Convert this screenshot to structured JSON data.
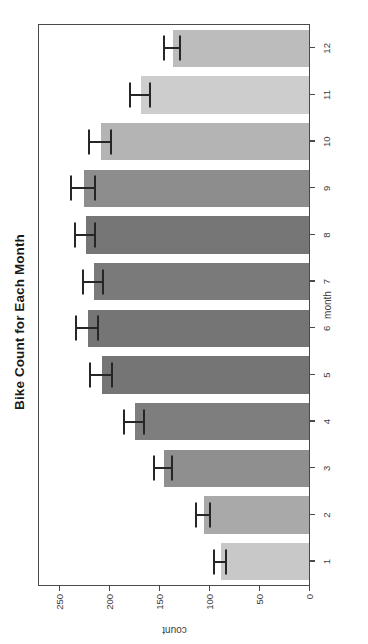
{
  "chart_data": {
    "type": "bar",
    "title": "Bike Count for Each Month",
    "xlabel": "month",
    "ylabel": "count",
    "categories": [
      "1",
      "2",
      "3",
      "4",
      "5",
      "6",
      "7",
      "8",
      "9",
      "10",
      "11",
      "12"
    ],
    "values": [
      88,
      105,
      145,
      174,
      207,
      221,
      215,
      223,
      225,
      208,
      168,
      136
    ],
    "errors": [
      6,
      7,
      9,
      10,
      11,
      11,
      10,
      10,
      12,
      11,
      10,
      8
    ],
    "bar_colors": [
      "#c8c8c8",
      "#a9a9a9",
      "#8f8f8f",
      "#7e7e7e",
      "#757575",
      "#757575",
      "#7a7a7a",
      "#767676",
      "#8d8d8d",
      "#b4b4b4",
      "#cdcdcd",
      "#bcbcbc"
    ],
    "ylim": [
      0,
      270
    ],
    "yticks": [
      0,
      50,
      100,
      150,
      200,
      250
    ],
    "ytick_labels": [
      "0",
      "50",
      "100",
      "150",
      "200",
      "250"
    ],
    "grid": false,
    "legend": false,
    "error_bar_color": "#262626",
    "axis_color": "#4a4a4a",
    "background": "#ffffff",
    "orientation": "rotated-90-ccw"
  }
}
